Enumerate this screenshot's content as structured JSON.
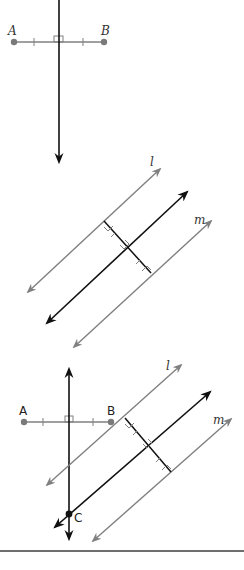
{
  "figure": {
    "panels": [
      {
        "id": "panel-1",
        "description": "Perpendicular bisector of segment AB",
        "labels": {
          "point_a": "A",
          "point_b": "B"
        }
      },
      {
        "id": "panel-2",
        "description": "Line midway between parallel lines l and m",
        "labels": {
          "line_l": "l",
          "line_m": "m"
        }
      },
      {
        "id": "panel-3",
        "description": "Point C equidistant from A and B and from lines l and m",
        "labels": {
          "point_a": "A",
          "point_b": "B",
          "line_l": "l",
          "line_m": "m",
          "point_c": "C"
        }
      }
    ],
    "colors": {
      "black_line": "#111111",
      "gray_line": "#808080",
      "point": "#7a7a7a",
      "rule": "#6e6e6e"
    }
  }
}
